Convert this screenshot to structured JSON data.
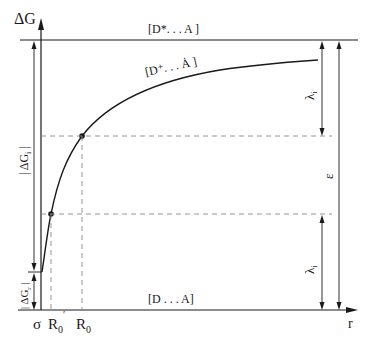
{
  "axes": {
    "y_label": "ΔG",
    "x_label": "r"
  },
  "levels": {
    "top_label": "[D*. . . A ]",
    "curve_label": "[D⁺. . . Ȧ ]",
    "bottom_label": "[D . . . A]"
  },
  "left_annotations": {
    "upper": "| ΔG",
    "upper_sub": "i",
    "upper_end": " |",
    "lower": "| ΔG",
    "lower_sub": "r",
    "lower_end": " |"
  },
  "right_annotations": {
    "lambda_top": "λ",
    "lambda_top_sub": "i",
    "epsilon": "ε",
    "lambda_bottom": "λ",
    "lambda_bottom_sub": "i"
  },
  "x_ticks": {
    "sigma": "σ",
    "r0_prime": "R",
    "r0_prime_sub": "0",
    "r0_prime_mark": "′",
    "r0": "R",
    "r0_sub": "0"
  },
  "colors": {
    "line": "#1a1a1a",
    "dashed": "#8a8a8a"
  }
}
